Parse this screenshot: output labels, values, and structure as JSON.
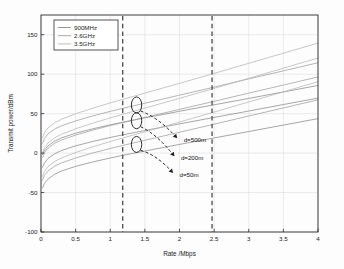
{
  "chart_data": {
    "type": "line",
    "title": "",
    "xlabel": "Rate /Mbps",
    "ylabel": "Transmit power/dBm",
    "xlim": [
      0,
      4
    ],
    "ylim": [
      -100,
      175
    ],
    "xticks": [
      "0",
      "0.5",
      "1",
      "1.5",
      "2",
      "2.5",
      "3",
      "3.5",
      "4"
    ],
    "xtick_values": [
      0,
      0.5,
      1,
      1.5,
      2,
      2.5,
      3,
      3.5,
      4
    ],
    "yticks": [
      "150",
      "100",
      "50",
      "0",
      "-50",
      "-100"
    ],
    "ytick_values": [
      150,
      100,
      50,
      0,
      -50,
      -100
    ],
    "grid": true,
    "legend_position": "upper-left",
    "legend": [
      "900MHz",
      "2.6GHz",
      "3.5GHz"
    ],
    "series": [
      {
        "name": "900MHz d=500m",
        "freq": "900MHz",
        "distance": "d=500m",
        "color": "#8a8a8a",
        "offset": 47.0,
        "bandwidth": 1.05,
        "x": [
          0.02,
          0.05,
          0.1,
          0.2,
          0.3,
          0.5,
          0.75,
          1.0,
          1.18,
          1.5,
          2.0,
          2.47,
          3.0,
          3.5,
          4.0
        ],
        "y": [
          -2.4,
          3.5,
          9.0,
          15.3,
          19.4,
          25.2,
          30.8,
          35.8,
          39.1,
          44.6,
          53.0,
          60.7,
          69.3,
          77.5,
          85.7
        ]
      },
      {
        "name": "900MHz d=200m",
        "freq": "900MHz",
        "distance": "d=200m",
        "color": "#8a8a8a",
        "offset": 31.0,
        "bandwidth": 1.05,
        "x": [
          0.02,
          0.05,
          0.1,
          0.2,
          0.3,
          0.5,
          0.75,
          1.0,
          1.18,
          1.5,
          2.0,
          2.47,
          3.0,
          3.5,
          4.0
        ],
        "y": [
          -18.4,
          -12.5,
          -7.0,
          -0.7,
          3.4,
          9.2,
          14.8,
          19.8,
          23.1,
          28.6,
          37.0,
          44.7,
          53.3,
          61.5,
          69.7
        ]
      },
      {
        "name": "900MHz d=50m",
        "freq": "900MHz",
        "distance": "d=50m",
        "color": "#8a8a8a",
        "offset": 5.0,
        "bandwidth": 1.05,
        "x": [
          0.02,
          0.05,
          0.1,
          0.2,
          0.3,
          0.5,
          0.75,
          1.0,
          1.18,
          1.5,
          2.0,
          2.47,
          3.0,
          3.5,
          4.0
        ],
        "y": [
          -44.4,
          -38.5,
          -33.0,
          -26.7,
          -22.6,
          -16.8,
          -11.2,
          -6.2,
          -2.9,
          2.6,
          11.0,
          18.7,
          27.3,
          35.5,
          43.7
        ]
      },
      {
        "name": "2.6GHz d=500m",
        "freq": "2.6GHz",
        "distance": "d=500m",
        "color": "#9e9e9e",
        "offset": 58.0,
        "bandwidth": 0.72,
        "x": [
          0.02,
          0.05,
          0.1,
          0.2,
          0.3,
          0.5,
          0.75,
          1.0,
          1.18,
          1.5,
          2.0,
          2.47,
          3.0,
          3.5,
          4.0
        ],
        "y": [
          12.0,
          18.5,
          24.2,
          30.6,
          34.7,
          40.8,
          47.2,
          52.9,
          56.7,
          63.2,
          73.4,
          83.0,
          94.0,
          104.2,
          114.5
        ]
      },
      {
        "name": "2.6GHz d=200m",
        "freq": "2.6GHz",
        "distance": "d=200m",
        "color": "#9e9e9e",
        "offset": 40.0,
        "bandwidth": 0.72,
        "x": [
          0.02,
          0.05,
          0.1,
          0.2,
          0.3,
          0.5,
          0.75,
          1.0,
          1.18,
          1.5,
          2.0,
          2.47,
          3.0,
          3.5,
          4.0
        ],
        "y": [
          -6.0,
          0.5,
          6.2,
          12.6,
          16.7,
          22.8,
          29.2,
          34.9,
          38.7,
          45.2,
          55.4,
          65.0,
          76.0,
          86.2,
          96.5
        ]
      },
      {
        "name": "2.6GHz d=50m",
        "freq": "2.6GHz",
        "distance": "d=50m",
        "color": "#9e9e9e",
        "offset": 11.0,
        "bandwidth": 0.72,
        "x": [
          0.02,
          0.05,
          0.1,
          0.2,
          0.3,
          0.5,
          0.75,
          1.0,
          1.18,
          1.5,
          2.0,
          2.47,
          3.0,
          3.5,
          4.0
        ],
        "y": [
          -35.0,
          -28.5,
          -22.8,
          -16.4,
          -12.3,
          -6.2,
          0.2,
          5.9,
          9.7,
          16.2,
          26.4,
          36.0,
          47.0,
          57.2,
          67.5
        ]
      },
      {
        "name": "3.5GHz d=500m",
        "freq": "3.5GHz",
        "distance": "d=500m",
        "color": "#b5b5b5",
        "offset": 63.0,
        "bandwidth": 0.6,
        "x": [
          0.02,
          0.05,
          0.1,
          0.2,
          0.3,
          0.5,
          0.75,
          1.0,
          1.18,
          1.5,
          2.0,
          2.47,
          3.0,
          3.5,
          4.0
        ],
        "y": [
          19.0,
          25.8,
          31.8,
          38.6,
          43.0,
          49.8,
          57.0,
          63.6,
          68.1,
          76.0,
          88.4,
          100.2,
          113.8,
          126.6,
          139.5
        ]
      },
      {
        "name": "3.5GHz d=200m",
        "freq": "3.5GHz",
        "distance": "d=200m",
        "color": "#b5b5b5",
        "offset": 44.0,
        "bandwidth": 0.6,
        "x": [
          0.02,
          0.05,
          0.1,
          0.2,
          0.3,
          0.5,
          0.75,
          1.0,
          1.18,
          1.5,
          2.0,
          2.47,
          3.0,
          3.5,
          4.0
        ],
        "y": [
          0.0,
          6.8,
          12.8,
          19.6,
          24.0,
          30.8,
          38.0,
          44.6,
          49.1,
          57.0,
          69.4,
          81.2,
          94.8,
          107.6,
          120.5
        ]
      },
      {
        "name": "3.5GHz d=50m",
        "freq": "3.5GHz",
        "distance": "d=50m",
        "color": "#b5b5b5",
        "offset": 14.0,
        "bandwidth": 0.6,
        "x": [
          0.02,
          0.05,
          0.1,
          0.2,
          0.3,
          0.5,
          0.75,
          1.0,
          1.18,
          1.5,
          2.0,
          2.47,
          3.0,
          3.5,
          4.0
        ],
        "y": [
          -30.0,
          -23.2,
          -17.2,
          -10.4,
          -6.0,
          0.8,
          8.0,
          14.6,
          19.1,
          27.0,
          39.4,
          51.2,
          64.8,
          77.6,
          90.5
        ]
      }
    ],
    "reference_lines": [
      {
        "name": "rate-threshold-low",
        "x": 1.18,
        "style": "dashed"
      },
      {
        "name": "rate-threshold-high",
        "x": 2.47,
        "style": "dashed"
      }
    ],
    "annotations": [
      {
        "label": "d=500m",
        "ellipse_x": 1.38,
        "ellipse_y": 61,
        "text_x": 2.06,
        "text_y": 17
      },
      {
        "label": "d=200m",
        "ellipse_x": 1.38,
        "ellipse_y": 41,
        "text_x": 2.02,
        "text_y": -6
      },
      {
        "label": "d=50m",
        "ellipse_x": 1.38,
        "ellipse_y": 11,
        "text_x": 2.0,
        "text_y": -27
      }
    ]
  },
  "colors": {
    "background": "#fdfdfd",
    "axis": "#2a2a2a",
    "grid": "#d8d8d8",
    "series_900": "#8a8a8a",
    "series_26": "#9e9e9e",
    "series_35": "#b5b5b5",
    "dashed_reference": "#4a4a4a",
    "annotation": "#111111"
  }
}
